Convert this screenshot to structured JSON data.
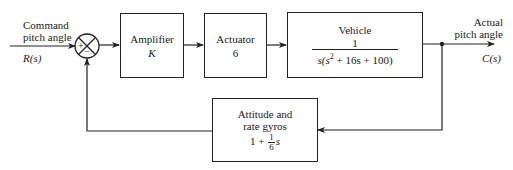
{
  "input": {
    "label_line1": "Command",
    "label_line2": "pitch angle",
    "signal": "R(s)"
  },
  "summing_junction": {
    "sign_top": "-",
    "sign_left": "+",
    "sign_bottom": "−"
  },
  "blocks": {
    "amplifier": {
      "title": "Amplifier",
      "value": "K"
    },
    "actuator": {
      "title": "Actuator",
      "value": "6"
    },
    "vehicle": {
      "title": "Vehicle",
      "numerator": "1",
      "denominator_pre": "s(s",
      "denominator_exp": "2",
      "denominator_post": " + 16s + 100)"
    },
    "feedback": {
      "title_line1": "Attitude and",
      "title_line2": "rate gyros",
      "expr_pre": "1 +",
      "frac_num": "1",
      "frac_den": "6",
      "expr_post": "s"
    }
  },
  "output": {
    "label_line1": "Actual",
    "label_line2": "pitch angle",
    "signal": "C(s)"
  },
  "colors": {
    "line": "#222222",
    "background": "#ffffff"
  }
}
